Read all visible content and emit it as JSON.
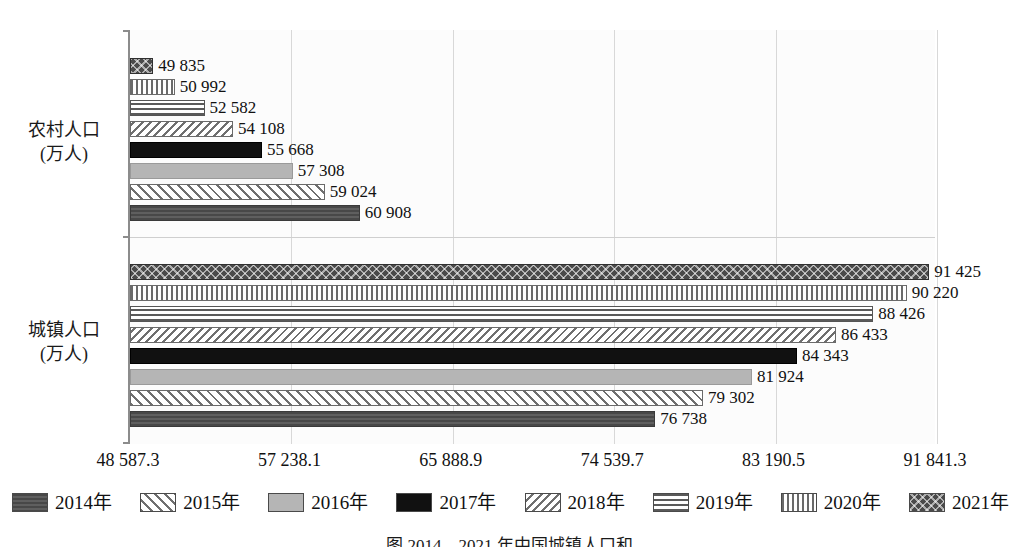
{
  "chart_data": {
    "type": "bar",
    "orientation": "horizontal",
    "title": "",
    "xlabel": "",
    "ylabel": "",
    "grid": true,
    "legend_position": "bottom",
    "categories": [
      "农村人口\n(万人)",
      "城镇人口\n(万人)"
    ],
    "category_labels": [
      {
        "line1": "农村人口",
        "line2": "(万人)"
      },
      {
        "line1": "城镇人口",
        "line2": "(万人)"
      }
    ],
    "xlim": [
      48587.3,
      91841.3
    ],
    "xticks": [
      "48 587.3",
      "57 238.1",
      "65 888.9",
      "74 539.7",
      "83 190.5",
      "91 841.3"
    ],
    "xtick_values": [
      48587.3,
      57238.1,
      65888.9,
      74539.7,
      83190.5,
      91841.3
    ],
    "series": [
      {
        "name": "2014年",
        "pattern": "solid-dark-gray",
        "values": [
          60908,
          76738
        ],
        "labels": [
          "60 908",
          "76 738"
        ]
      },
      {
        "name": "2015年",
        "pattern": "diagonal-hatch-right",
        "values": [
          59024,
          79302
        ],
        "labels": [
          "59 024",
          "79 302"
        ]
      },
      {
        "name": "2016年",
        "pattern": "solid-light-gray",
        "values": [
          57308,
          81924
        ],
        "labels": [
          "57 308",
          "81 924"
        ]
      },
      {
        "name": "2017年",
        "pattern": "solid-black",
        "values": [
          55668,
          84343
        ],
        "labels": [
          "55 668",
          "84 343"
        ]
      },
      {
        "name": "2018年",
        "pattern": "diagonal-hatch-left",
        "values": [
          54108,
          86433
        ],
        "labels": [
          "54 108",
          "86 433"
        ]
      },
      {
        "name": "2019年",
        "pattern": "horizontal-lines",
        "values": [
          52582,
          88426
        ],
        "labels": [
          "52 582",
          "88 426"
        ]
      },
      {
        "name": "2020年",
        "pattern": "vertical-lines",
        "values": [
          50992,
          90220
        ],
        "labels": [
          "50 992",
          "90 220"
        ]
      },
      {
        "name": "2021年",
        "pattern": "crosshatch-dark",
        "values": [
          49835,
          91425
        ],
        "labels": [
          "49 835",
          "91 425"
        ]
      }
    ]
  },
  "legend": {
    "items": [
      {
        "label": "2014年",
        "swatch": "p-2014"
      },
      {
        "label": "2015年",
        "swatch": "p-2015"
      },
      {
        "label": "2016年",
        "swatch": "p-2016"
      },
      {
        "label": "2017年",
        "swatch": "p-2017"
      },
      {
        "label": "2018年",
        "swatch": "p-2018"
      },
      {
        "label": "2019年",
        "swatch": "p-2019"
      },
      {
        "label": "2020年",
        "swatch": "p-2020"
      },
      {
        "label": "2021年",
        "swatch": "p-2021"
      }
    ]
  },
  "caption": "图 2014—2021 年中国城镇人口和"
}
